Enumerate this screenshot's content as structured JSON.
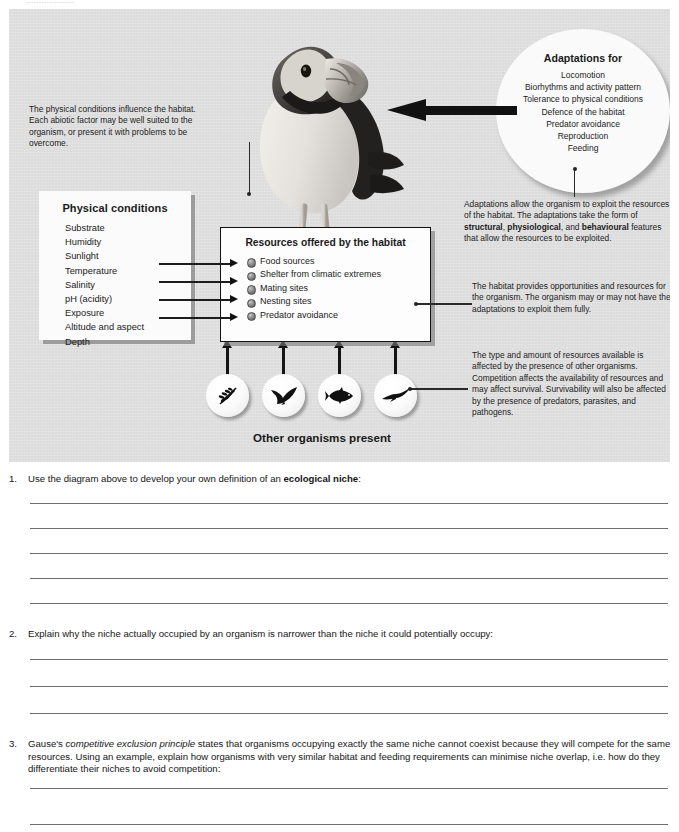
{
  "page": {
    "top_clipped_text": "...................",
    "background": "#ffffff",
    "panel_background": "#dcdcdc"
  },
  "diagram": {
    "photo_alt": "puffin-photograph",
    "physical_conditions": {
      "title": "Physical conditions",
      "items": [
        "Substrate",
        "Humidity",
        "Sunlight",
        "Temperature",
        "Salinity",
        "pH (acidity)",
        "Exposure",
        "Altitude and aspect",
        "Depth"
      ]
    },
    "physical_note": "The physical conditions influence the habitat. Each abiotic factor may be well suited to the organism, or present it with problems to be overcome.",
    "resources": {
      "title": "Resources offered by the habitat",
      "items": [
        "Food sources",
        "Shelter from climatic extremes",
        "Mating sites",
        "Nesting sites",
        "Predator avoidance"
      ]
    },
    "adaptations": {
      "title": "Adaptations for",
      "items": [
        "Locomotion",
        "Biorhythms and activity pattern",
        "Tolerance to physical conditions",
        "Defence of the habitat",
        "Predator avoidance",
        "Reproduction",
        "Feeding"
      ]
    },
    "adaptations_note": {
      "part1": "Adaptations allow the organism to exploit the resources of the habitat. The adaptations take the form of ",
      "bold1": "structural",
      "part2": ", ",
      "bold2": "physiological",
      "part3": ", and ",
      "bold3": "behavioural",
      "part4": " features that allow the resources to be exploited."
    },
    "habitat_note": "The habitat provides opportunities and resources for the organism. The organism may or may not have the adaptations to exploit them fully.",
    "competition_note": "The type and amount of resources available is affected by the presence of other organisms. Competition affects the availability of resources and may affect survival. Survivability will also be affected by the presence of predators, parasites, and pathogens.",
    "organisms_label": "Other organisms present",
    "organism_icons": [
      "plant-icon",
      "gull-icon",
      "fish-icon",
      "soaring-bird-icon"
    ]
  },
  "questions": [
    {
      "number": "1.",
      "pre": "Use the diagram above to develop your own definition of an ",
      "bold": "ecological niche",
      "post": ":",
      "lines": 5
    },
    {
      "number": "2.",
      "pre": "Explain why the niche actually occupied by an organism is narrower than the niche it could potentially occupy:",
      "bold": "",
      "post": "",
      "lines": 3
    },
    {
      "number": "3.",
      "pre": "Gause's ",
      "italic": "competitive exclusion principle",
      "post": " states that organisms occupying exactly the same niche cannot coexist because they will compete for the same resources. Using an example, explain how organisms with very similar habitat and feeding requirements can minimise niche overlap, i.e. how do they differentiate their niches to avoid competition:",
      "lines": 2
    }
  ]
}
